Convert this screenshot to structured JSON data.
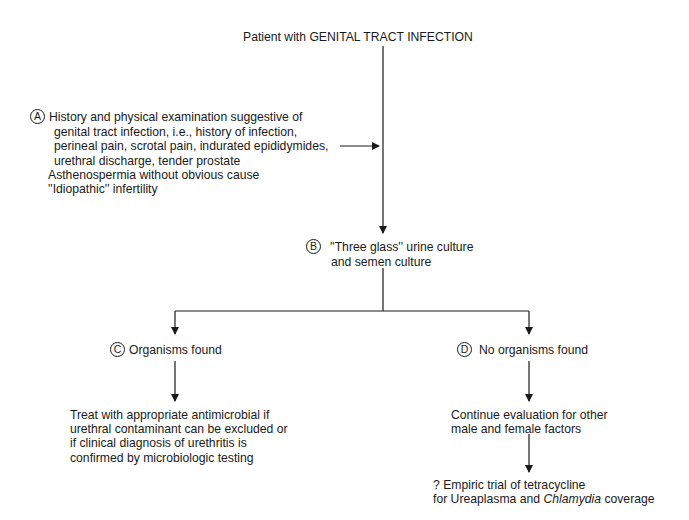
{
  "title": "Patient with GENITAL TRACT INFECTION",
  "nodes": {
    "A": {
      "marker": "A",
      "lines": [
        "History and physical examination suggestive of",
        "genital tract infection, i.e., history of infection,",
        "perineal pain, scrotal pain, indurated epididymides,",
        "urethral discharge, tender prostate",
        "Asthenospermia without obvious cause",
        "''Idiopathic'' infertility"
      ]
    },
    "B": {
      "marker": "B",
      "lines": [
        "''Three glass'' urine culture",
        "and semen culture"
      ]
    },
    "C": {
      "marker": "C",
      "label": "Organisms found"
    },
    "D": {
      "marker": "D",
      "label": "No organisms found"
    },
    "C_action": {
      "lines": [
        "Treat with appropriate antimicrobial if",
        "urethral contaminant can be excluded or",
        "if clinical diagnosis of urethritis is",
        "confirmed by microbiologic testing"
      ]
    },
    "D_action": {
      "lines": [
        "Continue evaluation for other",
        "male and female factors"
      ]
    },
    "D_final": {
      "line1": "? Empiric trial of tetracycline",
      "line2_prefix": "for Ureaplasma and ",
      "line2_italic": "Chlamydia",
      "line2_suffix": " coverage"
    }
  }
}
